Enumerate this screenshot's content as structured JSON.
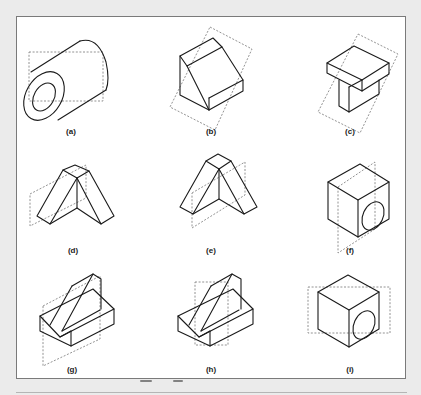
{
  "figure": {
    "colors": {
      "background": "#ebebeb",
      "panel": "#ffffff",
      "border": "#7a7a7a",
      "solid_line": "#1a1a1a",
      "plane_line": "#777777"
    },
    "panels": [
      {
        "id": "a",
        "label": "(a)",
        "shape": "hollow cylinder",
        "plane": "vertical dashed rectangle"
      },
      {
        "id": "b",
        "label": "(b)",
        "shape": "block with inclined face",
        "plane": "tilted dashed rectangle"
      },
      {
        "id": "c",
        "label": "(c)",
        "shape": "T-shaped block",
        "plane": "tilted dashed rectangle"
      },
      {
        "id": "d",
        "label": "(d)",
        "shape": "inverted V / A-frame",
        "plane": "vertical dashed rectangle"
      },
      {
        "id": "e",
        "label": "(e)",
        "shape": "inverted V / A-frame",
        "plane": "vertical dashed rectangle"
      },
      {
        "id": "f",
        "label": "(f)",
        "shape": "cube with circular hole",
        "plane": "vertical dashed rectangle"
      },
      {
        "id": "g",
        "label": "(g)",
        "shape": "base block with inclined rib",
        "plane": "vertical dashed rectangle"
      },
      {
        "id": "h",
        "label": "(h)",
        "shape": "base block with inclined rib",
        "plane": "vertical dashed rectangle"
      },
      {
        "id": "i",
        "label": "(i)",
        "shape": "cube with circular hole",
        "plane": "horizontal dashed rectangle"
      }
    ]
  }
}
